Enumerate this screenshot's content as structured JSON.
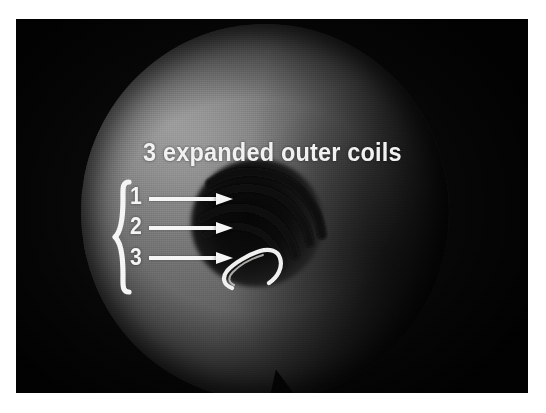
{
  "figure": {
    "kind": "medical-photograph",
    "modality": "grayscale radiograph / specimen photograph",
    "background_color": "#ffffff",
    "plate_color": "#0a0a0a"
  },
  "annotations": {
    "title": "3 expanded outer coils",
    "title_color": "#f2f2f2",
    "brace_label": "{",
    "brace_color": "#f5f5f5",
    "arrow_color": "#f6f6f6",
    "markers": [
      {
        "label": "1",
        "arrow": "arrow-right",
        "points_to": "outer-coil-1"
      },
      {
        "label": "2",
        "arrow": "arrow-right",
        "points_to": "outer-coil-2"
      },
      {
        "label": "3",
        "arrow": "arrow-right",
        "points_to": "outer-coil-3"
      }
    ]
  },
  "specimen": {
    "disc_label": "round specimen disc",
    "core_label": "dark central coil mass",
    "hook_label": "bright inner coil hook",
    "notch_label": "bottom notch",
    "arc_count": 3
  }
}
